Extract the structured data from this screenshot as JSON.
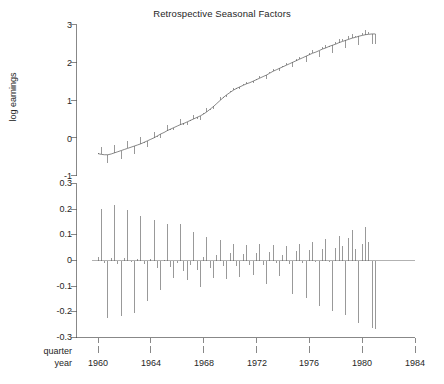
{
  "figure": {
    "width": 444,
    "height": 384,
    "background": "#ffffff",
    "ink": "#555555",
    "text_color": "#262626"
  },
  "chart_data": {
    "type": "line",
    "title": "Retrospective Seasonal Factors",
    "panels": [
      {
        "id": "trend-panel",
        "ylabel": "log earnings",
        "ylim": [
          -1,
          3
        ],
        "yticks": [
          3,
          2,
          1,
          0,
          -1
        ],
        "ytick_labels": [
          "3",
          "2",
          "1",
          "0",
          "-1"
        ],
        "xlim": [
          1960,
          1984
        ],
        "grid": false,
        "series_name": "log earnings trend with seasonal sub-series",
        "x": [
          1960.0,
          1960.25,
          1960.5,
          1960.75,
          1961.0,
          1961.25,
          1961.5,
          1961.75,
          1962.0,
          1962.25,
          1962.5,
          1962.75,
          1963.0,
          1963.25,
          1963.5,
          1963.75,
          1964.0,
          1964.25,
          1964.5,
          1964.75,
          1965.0,
          1965.25,
          1965.5,
          1965.75,
          1966.0,
          1966.25,
          1966.5,
          1966.75,
          1967.0,
          1967.25,
          1967.5,
          1967.75,
          1968.0,
          1968.25,
          1968.5,
          1968.75,
          1969.0,
          1969.25,
          1969.5,
          1969.75,
          1970.0,
          1970.25,
          1970.5,
          1970.75,
          1971.0,
          1971.25,
          1971.5,
          1971.75,
          1972.0,
          1972.25,
          1972.5,
          1972.75,
          1973.0,
          1973.25,
          1973.5,
          1973.75,
          1974.0,
          1974.25,
          1974.5,
          1974.75,
          1975.0,
          1975.25,
          1975.5,
          1975.75,
          1976.0,
          1976.25,
          1976.5,
          1976.75,
          1977.0,
          1977.25,
          1977.5,
          1977.75,
          1978.0,
          1978.25,
          1978.5,
          1978.75,
          1979.0,
          1979.25,
          1979.5,
          1979.75,
          1980.0,
          1980.25,
          1980.5,
          1980.75,
          1981.0
        ],
        "trend": [
          -0.42,
          -0.44,
          -0.45,
          -0.45,
          -0.43,
          -0.4,
          -0.37,
          -0.34,
          -0.31,
          -0.28,
          -0.25,
          -0.22,
          -0.19,
          -0.16,
          -0.12,
          -0.08,
          -0.04,
          0.0,
          0.05,
          0.1,
          0.14,
          0.19,
          0.23,
          0.27,
          0.31,
          0.35,
          0.38,
          0.42,
          0.46,
          0.5,
          0.54,
          0.58,
          0.63,
          0.69,
          0.76,
          0.83,
          0.91,
          0.99,
          1.07,
          1.14,
          1.2,
          1.26,
          1.31,
          1.35,
          1.39,
          1.43,
          1.46,
          1.5,
          1.54,
          1.58,
          1.62,
          1.66,
          1.71,
          1.76,
          1.8,
          1.84,
          1.88,
          1.92,
          1.96,
          2.0,
          2.04,
          2.08,
          2.12,
          2.16,
          2.2,
          2.24,
          2.27,
          2.31,
          2.35,
          2.38,
          2.42,
          2.45,
          2.48,
          2.52,
          2.55,
          2.58,
          2.61,
          2.64,
          2.66,
          2.69,
          2.71,
          2.73,
          2.74,
          2.75,
          2.75
        ]
      },
      {
        "id": "seasonal-panel",
        "ylabel": "",
        "ylim": [
          -0.3,
          0.3
        ],
        "yticks": [
          0.3,
          0.2,
          0.1,
          0,
          -0.1,
          -0.2,
          -0.3
        ],
        "ytick_labels": [
          "0.3",
          "0.2",
          "0.1",
          "0",
          "-0.1",
          "-0.2",
          "-0.3"
        ],
        "xlim": [
          1960,
          1984
        ],
        "grid": false,
        "baseline": 0,
        "series_name": "seasonal factor",
        "x": [
          1960.0,
          1960.25,
          1960.5,
          1960.75,
          1961.0,
          1961.25,
          1961.5,
          1961.75,
          1962.0,
          1962.25,
          1962.5,
          1962.75,
          1963.0,
          1963.25,
          1963.5,
          1963.75,
          1964.0,
          1964.25,
          1964.5,
          1964.75,
          1965.0,
          1965.25,
          1965.5,
          1965.75,
          1966.0,
          1966.25,
          1966.5,
          1966.75,
          1967.0,
          1967.25,
          1967.5,
          1967.75,
          1968.0,
          1968.25,
          1968.5,
          1968.75,
          1969.0,
          1969.25,
          1969.5,
          1969.75,
          1970.0,
          1970.25,
          1970.5,
          1970.75,
          1971.0,
          1971.25,
          1971.5,
          1971.75,
          1972.0,
          1972.25,
          1972.5,
          1972.75,
          1973.0,
          1973.25,
          1973.5,
          1973.75,
          1974.0,
          1974.25,
          1974.5,
          1974.75,
          1975.0,
          1975.25,
          1975.5,
          1975.75,
          1976.0,
          1976.25,
          1976.5,
          1976.75,
          1977.0,
          1977.25,
          1977.5,
          1977.75,
          1978.0,
          1978.25,
          1978.5,
          1978.75,
          1979.0,
          1979.25,
          1979.5,
          1979.75,
          1980.0,
          1980.25,
          1980.5,
          1980.75,
          1981.0
        ],
        "values": [
          0.012,
          0.2,
          -0.008,
          -0.223,
          0.01,
          0.216,
          -0.012,
          -0.215,
          0.008,
          0.198,
          -0.006,
          -0.203,
          0.006,
          0.172,
          -0.014,
          -0.156,
          0.004,
          0.156,
          -0.03,
          -0.115,
          0.002,
          0.142,
          -0.026,
          -0.068,
          -0.01,
          0.142,
          -0.04,
          -0.076,
          -0.018,
          0.111,
          -0.036,
          -0.104,
          0.014,
          0.092,
          -0.028,
          -0.068,
          0.022,
          0.079,
          -0.022,
          -0.072,
          0.03,
          0.064,
          -0.02,
          -0.066,
          0.024,
          0.06,
          -0.018,
          -0.058,
          0.028,
          0.063,
          -0.016,
          -0.092,
          0.034,
          0.06,
          -0.01,
          -0.062,
          0.02,
          0.057,
          -0.014,
          -0.132,
          0.038,
          0.063,
          -0.008,
          -0.146,
          0.042,
          0.074,
          -0.006,
          -0.176,
          0.046,
          0.082,
          -0.004,
          -0.198,
          0.05,
          0.096,
          0.058,
          -0.212,
          0.088,
          0.12,
          0.046,
          -0.244,
          0.064,
          0.132,
          0.074,
          -0.264,
          -0.268
        ]
      }
    ],
    "xticks": [
      1960,
      1964,
      1968,
      1972,
      1976,
      1980,
      1984
    ],
    "xtick_labels": [
      "1960",
      "1964",
      "1968",
      "1972",
      "1976",
      "1980",
      "1984"
    ],
    "xaxis_rows": [
      "quarter",
      "year"
    ],
    "quarter_tick_row_label": "quarter",
    "year_tick_row_label": "year"
  }
}
